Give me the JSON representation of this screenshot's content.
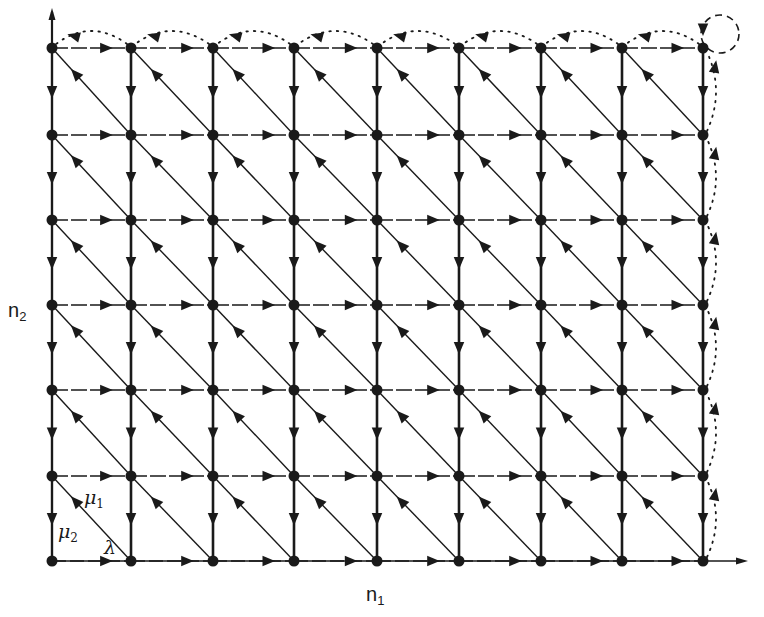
{
  "diagram": {
    "type": "state-transition lattice",
    "axes": {
      "x_label": "n",
      "x_label_sub": "1",
      "y_label": "n",
      "y_label_sub": "2"
    },
    "grid": {
      "columns_x": [
        52,
        131,
        213,
        294,
        377,
        459,
        541,
        622,
        703
      ],
      "rows_y": [
        48,
        135,
        220,
        305,
        390,
        476,
        561
      ]
    },
    "rate_labels": {
      "mu1": {
        "symbol": "μ",
        "sub": "1"
      },
      "mu2": {
        "symbol": "μ",
        "sub": "2"
      },
      "lambda": {
        "symbol": "λ"
      }
    },
    "transitions": {
      "horizontal": "λ (right, dashed)",
      "vertical": "μ2 (down, bold)",
      "diagonal": "μ1 (up-left)",
      "boundary_top": "dotted arcs leftward",
      "boundary_right": "dotted arcs upward",
      "corner": "dashed self-loop"
    },
    "colors": {
      "ink": "#1a1a1a",
      "background": "#ffffff"
    }
  }
}
